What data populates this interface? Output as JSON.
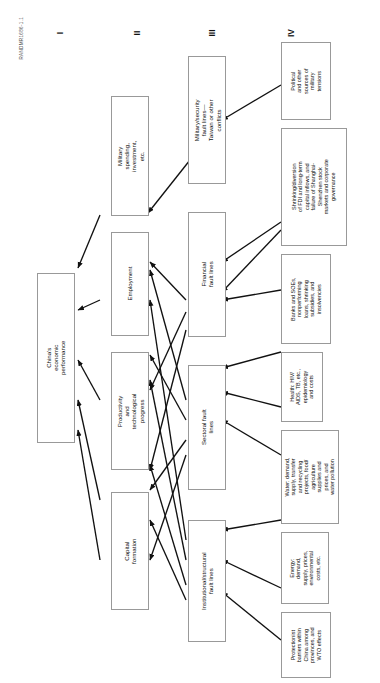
{
  "figure": {
    "credit": "RANDMR1686-1.1",
    "orientation": "rotated-90"
  },
  "columns": [
    {
      "numeral": "I",
      "name": "outcome"
    },
    {
      "numeral": "II",
      "name": "proximate-drivers"
    },
    {
      "numeral": "III",
      "name": "fault-line-categories"
    },
    {
      "numeral": "IV",
      "name": "specific-fault-lines"
    }
  ],
  "level1": [
    {
      "id": "china-econ",
      "label": "China's economic performance"
    }
  ],
  "level2": [
    {
      "id": "military-spending",
      "label": "Military spending,\ninvestment, etc."
    },
    {
      "id": "employment",
      "label": "Employment"
    },
    {
      "id": "productivity",
      "label": "Productivity and\ntechnological progress"
    },
    {
      "id": "capital-formation",
      "label": "Capital formation"
    }
  ],
  "level3": [
    {
      "id": "military-security",
      "label": "Military/security fault lines—\nTaiwan or other conflicts"
    },
    {
      "id": "financial",
      "label": "Financial fault lines"
    },
    {
      "id": "sectoral",
      "label": "Sectoral fault lines"
    },
    {
      "id": "institutional",
      "label": "Institutional/structural\nfault lines"
    }
  ],
  "level4": [
    {
      "id": "political-military",
      "italic": "",
      "label": "Political\nand other\nsources of\nmilitary\ntensions"
    },
    {
      "id": "fdi-capital",
      "italic": "FDI",
      "label": "Shrinking/diversion\nof FDI and long-term\ncapital inflows, and\nfailure of Shanghai-\nShenzhen stock\nmarkets and corporate\ngovernance"
    },
    {
      "id": "banks-soes",
      "italic": "Banks and SOEs,",
      "label": "Banks and SOEs,\nnonperforming\nloans, shrinking\nsubsidies, and\ninsolvencies"
    },
    {
      "id": "health",
      "italic": "Health:",
      "label": "Health: HIV/\nAIDS, TB, etc.,\nepidemiology\nand costs"
    },
    {
      "id": "water",
      "italic": "Water:",
      "label": "Water: demand,\nsupply, transfer\nand recycling\nprojects, food/\nagriculture\nsupplies and\nprices, and\nwater pollution"
    },
    {
      "id": "energy",
      "italic": "Energy:",
      "label": "Energy:\ndemand,\nsupply, prices,\nenvironmental\ncosts, etc."
    },
    {
      "id": "protectionist",
      "italic": "Protectionist",
      "label": "Protectionist\nbarriers within\nChina among\nprovinces, and\nWTO effects"
    },
    {
      "id": "corruption",
      "italic": "",
      "label": "Corruption,\ntaxes, arbitrary\nfees, other\nlevies, nepotism,\nand urban-rural\nunrest"
    },
    {
      "id": "unemployment",
      "italic": "Unemployment,",
      "label": "Unemployment,\nrural poverty,\netc."
    }
  ],
  "colors": {
    "box_border": "#999999",
    "arrow": "#111111",
    "text": "#111111",
    "background": "#ffffff"
  }
}
